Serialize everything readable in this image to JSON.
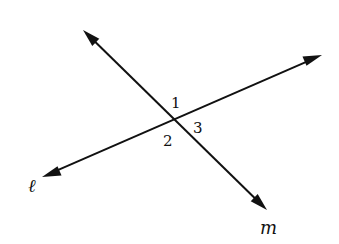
{
  "diagram": {
    "colors": {
      "stroke": "#111111",
      "background": "#ffffff"
    },
    "intersection": {
      "x": 174,
      "y": 118
    },
    "lines": [
      {
        "name": "l",
        "label": "ℓ",
        "start": {
          "x": 42,
          "y": 177
        },
        "end": {
          "x": 322,
          "y": 55
        },
        "arrows": "both",
        "label_pos": {
          "x": 28,
          "y": 192
        }
      },
      {
        "name": "m",
        "label": "m",
        "start": {
          "x": 83,
          "y": 30
        },
        "end": {
          "x": 267,
          "y": 210
        },
        "arrows": "both",
        "label_pos": {
          "x": 260,
          "y": 234
        }
      }
    ],
    "angles": [
      {
        "label": "1",
        "x": 171,
        "y": 108
      },
      {
        "label": "2",
        "x": 163,
        "y": 146
      },
      {
        "label": "3",
        "x": 193,
        "y": 133
      }
    ]
  }
}
